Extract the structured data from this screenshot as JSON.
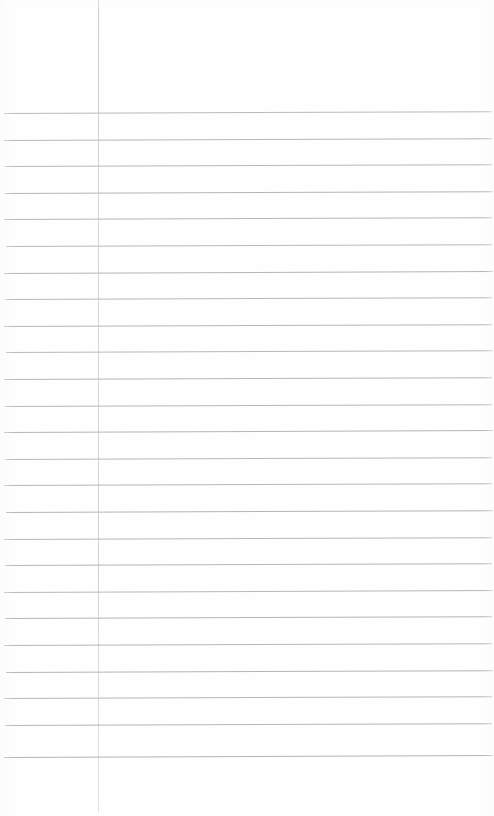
{
  "page": {
    "kind": "scanned-ruled-notebook-page",
    "width": 494,
    "height": 816,
    "background_color": "#ffffff",
    "content_text": "",
    "has_handwriting": false,
    "has_printed_text": false
  },
  "margin_rule": {
    "name": "vertical-margin-line",
    "color": "#bcbcc4",
    "x": 98,
    "top": 0,
    "bottom": 812,
    "thickness": 1
  },
  "ruling": {
    "name": "horizontal-ruled-lines",
    "color": "#aeaeb4",
    "line_count": 25,
    "first_line_y": 113,
    "spacing": 26.6,
    "left_x": 4,
    "right_x": 492,
    "thickness": 1,
    "skew_degrees": -0.22,
    "lines": [
      {
        "y": 113,
        "opacity": 0.85,
        "left": 4,
        "right": 492
      },
      {
        "y": 139.6,
        "opacity": 0.9,
        "left": 4,
        "right": 492
      },
      {
        "y": 166.2,
        "opacity": 0.88,
        "left": 5,
        "right": 492
      },
      {
        "y": 192.8,
        "opacity": 0.92,
        "left": 5,
        "right": 493
      },
      {
        "y": 219.4,
        "opacity": 0.9,
        "left": 4,
        "right": 492
      },
      {
        "y": 246.0,
        "opacity": 0.86,
        "left": 6,
        "right": 492
      },
      {
        "y": 272.6,
        "opacity": 0.92,
        "left": 4,
        "right": 493
      },
      {
        "y": 299.2,
        "opacity": 0.88,
        "left": 5,
        "right": 492
      },
      {
        "y": 325.8,
        "opacity": 0.9,
        "left": 4,
        "right": 492
      },
      {
        "y": 352.4,
        "opacity": 0.87,
        "left": 6,
        "right": 493
      },
      {
        "y": 379.0,
        "opacity": 0.91,
        "left": 4,
        "right": 492
      },
      {
        "y": 405.6,
        "opacity": 0.89,
        "left": 5,
        "right": 492
      },
      {
        "y": 432.2,
        "opacity": 0.92,
        "left": 4,
        "right": 493
      },
      {
        "y": 458.8,
        "opacity": 0.88,
        "left": 5,
        "right": 492
      },
      {
        "y": 485.4,
        "opacity": 0.9,
        "left": 4,
        "right": 492
      },
      {
        "y": 512.0,
        "opacity": 0.93,
        "left": 6,
        "right": 493
      },
      {
        "y": 538.6,
        "opacity": 0.89,
        "left": 4,
        "right": 492
      },
      {
        "y": 565.2,
        "opacity": 0.91,
        "left": 5,
        "right": 492
      },
      {
        "y": 591.8,
        "opacity": 0.88,
        "left": 4,
        "right": 493
      },
      {
        "y": 618.4,
        "opacity": 0.92,
        "left": 5,
        "right": 492
      },
      {
        "y": 645.0,
        "opacity": 0.9,
        "left": 4,
        "right": 492
      },
      {
        "y": 671.6,
        "opacity": 0.93,
        "left": 6,
        "right": 493
      },
      {
        "y": 698.2,
        "opacity": 0.89,
        "left": 4,
        "right": 492
      },
      {
        "y": 724.8,
        "opacity": 0.91,
        "left": 5,
        "right": 492
      },
      {
        "y": 757.0,
        "opacity": 0.94,
        "left": 4,
        "right": 493
      }
    ]
  }
}
